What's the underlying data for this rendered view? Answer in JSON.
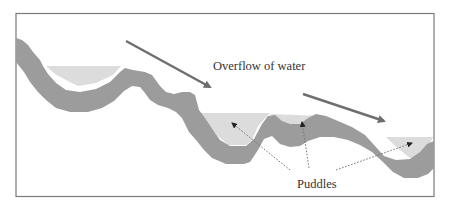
{
  "diagram": {
    "labels": {
      "overflow": "Overflow of water",
      "puddles": "Puddles"
    },
    "colors": {
      "frame": "#7a7a7a",
      "terrain": "#9c9c9c",
      "water": "#dcdcdc",
      "flow_arrow": "#6e6e6e",
      "pointer_line": "#777777",
      "pointer_head": "#222222",
      "text": "#333333"
    },
    "elements": {
      "frame": "rectangular border",
      "terrain": "wavy gray ground band descending from left to right",
      "puddles": [
        "left puddle",
        "middle-left puddle",
        "middle puddle",
        "right puddle"
      ],
      "flow_arrows": [
        "upper-left overflow arrow",
        "lower-right overflow arrow"
      ],
      "pointers": [
        "dotted pointer to middle-left puddle",
        "dotted pointer to middle puddle",
        "dotted pointer to right puddle"
      ]
    }
  }
}
